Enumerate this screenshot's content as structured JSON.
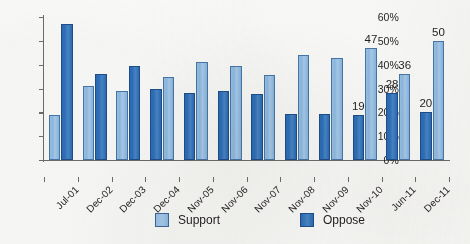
{
  "chart_data": {
    "type": "bar",
    "title": "",
    "subtitle": "",
    "xlabel": "",
    "ylabel": "",
    "ylim": [
      0,
      60
    ],
    "ytick_labels": [
      "0%",
      "10%",
      "20%",
      "30%",
      "40%",
      "50%",
      "60%"
    ],
    "ytick_values": [
      0,
      10,
      20,
      30,
      40,
      50,
      60
    ],
    "grid": false,
    "legend_position": "bottom",
    "categories": [
      "Jul-01",
      "Dec-02",
      "Dec-03",
      "Dec-04",
      "Nov-05",
      "Nov-06",
      "Nov-07",
      "Nov-08",
      "Nov-09",
      "Nov-10",
      "Jun-11",
      "Dec-11"
    ],
    "series": [
      {
        "name": "Support",
        "color": "#9cc3e8",
        "values": [
          19,
          31,
          29,
          35,
          41,
          39.5,
          35.5,
          44,
          43,
          47,
          36,
          50
        ]
      },
      {
        "name": "Oppose",
        "color": "#2d6db8",
        "values": [
          57,
          36,
          39.5,
          30,
          28,
          29,
          27.5,
          19.5,
          19.5,
          19,
          28,
          20
        ]
      }
    ],
    "series_draw_order": [
      [
        "Support",
        "Oppose"
      ],
      [
        "Support",
        "Oppose"
      ],
      [
        "Support",
        "Oppose"
      ],
      [
        "Oppose",
        "Support"
      ],
      [
        "Oppose",
        "Support"
      ],
      [
        "Oppose",
        "Support"
      ],
      [
        "Oppose",
        "Support"
      ],
      [
        "Oppose",
        "Support"
      ],
      [
        "Oppose",
        "Support"
      ],
      [
        "Oppose",
        "Support"
      ],
      [
        "Oppose",
        "Support"
      ],
      [
        "Oppose",
        "Support"
      ]
    ],
    "data_labels": [
      {
        "category": "Nov-10",
        "series": "Oppose",
        "text": "19"
      },
      {
        "category": "Nov-10",
        "series": "Support",
        "text": "47"
      },
      {
        "category": "Jun-11",
        "series": "Oppose",
        "text": "28"
      },
      {
        "category": "Jun-11",
        "series": "Support",
        "text": "36"
      },
      {
        "category": "Dec-11",
        "series": "Oppose",
        "text": "20"
      },
      {
        "category": "Dec-11",
        "series": "Support",
        "text": "50"
      }
    ]
  },
  "legend": {
    "items": [
      {
        "label": "Support",
        "color": "#9cc3e8"
      },
      {
        "label": "Oppose",
        "color": "#2d6db8"
      }
    ]
  }
}
